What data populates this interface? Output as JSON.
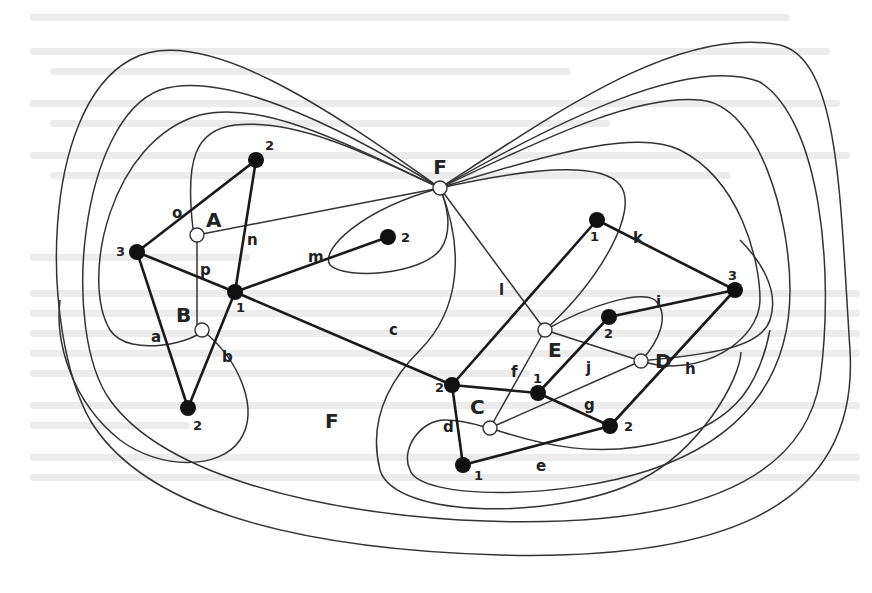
{
  "diagram": {
    "type": "planar graph with dual graph",
    "colors": {
      "primal_edge": "#1a1a1a",
      "dual_edge": "#333333",
      "primal_vertex_fill": "#111111",
      "dual_vertex_fill": "#ffffff",
      "background": "#ffffff",
      "bleed_text": "#ececec"
    },
    "faces": {
      "outer_face_label": "F",
      "outer_face_label_2": "F"
    },
    "dual_vertices": [
      {
        "id": "F",
        "label": "F",
        "x": 440,
        "y": 188
      },
      {
        "id": "A",
        "label": "A",
        "x": 197,
        "y": 235
      },
      {
        "id": "B",
        "label": "B",
        "x": 202,
        "y": 330
      },
      {
        "id": "C",
        "label": "C",
        "x": 490,
        "y": 428
      },
      {
        "id": "D",
        "label": "D",
        "x": 641,
        "y": 361
      },
      {
        "id": "E",
        "label": "E",
        "x": 545,
        "y": 330
      }
    ],
    "primal_vertices": [
      {
        "id": "v3a",
        "degree_label": "3",
        "x": 137,
        "y": 252
      },
      {
        "id": "v2a",
        "degree_label": "2",
        "x": 256,
        "y": 160
      },
      {
        "id": "v1a",
        "degree_label": "1",
        "x": 235,
        "y": 292
      },
      {
        "id": "v2b",
        "degree_label": "2",
        "x": 188,
        "y": 408
      },
      {
        "id": "v2m",
        "degree_label": "2",
        "x": 388,
        "y": 237
      },
      {
        "id": "v1k",
        "degree_label": "1",
        "x": 597,
        "y": 220
      },
      {
        "id": "v3h",
        "degree_label": "3",
        "x": 735,
        "y": 290
      },
      {
        "id": "v2j",
        "degree_label": "2",
        "x": 609,
        "y": 317
      },
      {
        "id": "v2c",
        "degree_label": "2",
        "x": 452,
        "y": 385
      },
      {
        "id": "v1f",
        "degree_label": "1",
        "x": 538,
        "y": 393
      },
      {
        "id": "v2g",
        "degree_label": "2",
        "x": 610,
        "y": 426
      },
      {
        "id": "v1d",
        "degree_label": "1",
        "x": 463,
        "y": 465
      }
    ],
    "edge_labels": [
      {
        "label": "o",
        "x": 172,
        "y": 218
      },
      {
        "label": "n",
        "x": 247,
        "y": 245
      },
      {
        "label": "p",
        "x": 200,
        "y": 275
      },
      {
        "label": "m",
        "x": 313,
        "y": 260
      },
      {
        "label": "a",
        "x": 155,
        "y": 340
      },
      {
        "label": "b",
        "x": 221,
        "y": 362
      },
      {
        "label": "c",
        "x": 389,
        "y": 335
      },
      {
        "label": "l",
        "x": 499,
        "y": 291
      },
      {
        "label": "k",
        "x": 636,
        "y": 243
      },
      {
        "label": "i",
        "x": 658,
        "y": 307
      },
      {
        "label": "j",
        "x": 588,
        "y": 373
      },
      {
        "label": "h",
        "x": 687,
        "y": 374
      },
      {
        "label": "f",
        "x": 511,
        "y": 377
      },
      {
        "label": "g",
        "x": 586,
        "y": 410
      },
      {
        "label": "d",
        "x": 446,
        "y": 432
      },
      {
        "label": "e",
        "x": 538,
        "y": 471
      },
      {
        "label": "F",
        "x": 330,
        "y": 427
      }
    ],
    "primal_edges": [
      {
        "name": "o",
        "from": "v3a",
        "to": "v2a"
      },
      {
        "name": "n",
        "from": "v2a",
        "to": "v1a"
      },
      {
        "name": "p",
        "from": "v3a",
        "to": "v1a"
      },
      {
        "name": "a",
        "from": "v3a",
        "to": "v2b"
      },
      {
        "name": "b",
        "from": "v1a",
        "to": "v2b"
      },
      {
        "name": "m",
        "from": "v1a",
        "to": "v2m"
      },
      {
        "name": "c",
        "from": "v1a",
        "to": "v2c"
      },
      {
        "name": "l",
        "from": "v2c",
        "to": "v1k"
      },
      {
        "name": "k",
        "from": "v1k",
        "to": "v3h"
      },
      {
        "name": "i",
        "from": "v2j",
        "to": "v3h"
      },
      {
        "name": "h",
        "from": "v3h",
        "to": "v2g"
      },
      {
        "name": "j",
        "from": "v1f",
        "to": "v2j"
      },
      {
        "name": "f",
        "from": "v2c",
        "to": "v1f"
      },
      {
        "name": "g",
        "from": "v1f",
        "to": "v2g"
      },
      {
        "name": "d",
        "from": "v2c",
        "to": "v1d"
      },
      {
        "name": "e",
        "from": "v1d",
        "to": "v2g"
      }
    ]
  }
}
